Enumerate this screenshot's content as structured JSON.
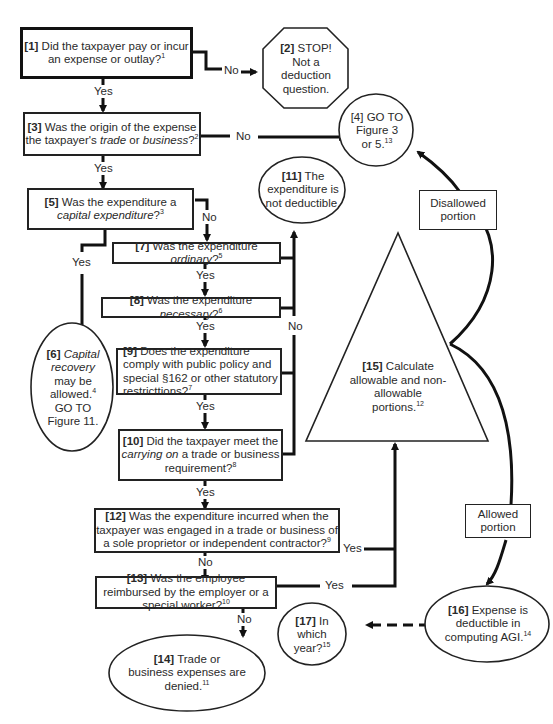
{
  "diagram": {
    "type": "flowchart",
    "nodes": {
      "n1": {
        "num": "[1]",
        "pre": "Did the taxpayer pay or incur an expense or outlay?",
        "fn": "1"
      },
      "n2": {
        "num": "[2]",
        "line1": "STOP!",
        "line2": "Not a",
        "line3": "deduction",
        "line4": "question."
      },
      "n3": {
        "num": "[3]",
        "pre": "Was the origin of the expense the taxpayer's ",
        "it1": "trade",
        "mid": " or ",
        "it2": "business",
        "post": "?",
        "fn": "2"
      },
      "n4": {
        "num": "[4]",
        "line1": "GO TO",
        "line2": "Figure 3",
        "line3": "or 5.",
        "fn": "13"
      },
      "n5": {
        "num": "[5]",
        "pre": "Was the expenditure a",
        "it": "capital expenditure",
        "post": "?",
        "fn": "3"
      },
      "n6": {
        "num": "[6]",
        "it1": "Capital",
        "it2": "recovery",
        "line3": "may be",
        "line4": "allowed.",
        "fn": "4",
        "line5": "GO TO",
        "line6": "Figure 11."
      },
      "n7": {
        "num": "[7]",
        "pre": "Was the expenditure ",
        "it": "ordinary",
        "post": "?",
        "fn": "5"
      },
      "n8": {
        "num": "[8]",
        "pre": "Was the expenditure ",
        "it": "necessary",
        "post": "?",
        "fn": "6"
      },
      "n9": {
        "num": "[9]",
        "text": "Does the expenditure comply with public policy and special §162 or other statutory restricttions?",
        "fn": "7"
      },
      "n10": {
        "num": "[10]",
        "pre": "Did the taxpayer meet the",
        "it": "carrying on",
        "post": " a trade or business requirement?",
        "fn": "8"
      },
      "n11": {
        "num": "[11]",
        "line1": "The",
        "line2": "expenditure is",
        "line3": "not deductible."
      },
      "n12": {
        "num": "[12]",
        "text": "Was the expenditure incurred when the taxpayer was engaged in a trade or business of a sole proprietor or independent contractor?",
        "fn": "9"
      },
      "n13": {
        "num": "[13]",
        "text": "Was the employee reimbursed by the employer or a special worker?",
        "fn": "10"
      },
      "n14": {
        "num": "[14]",
        "line1": "Trade or",
        "line2": "business expenses are",
        "line3": "denied.",
        "fn": "11"
      },
      "n15": {
        "num": "[15]",
        "line1": "Calculate",
        "line2": "allowable and non-",
        "line3": "allowable",
        "line4": "portions.",
        "fn": "12"
      },
      "n16": {
        "num": "[16]",
        "line1": "Expense is",
        "line2": "deductible in",
        "line3": "computing AGI.",
        "fn": "14"
      },
      "n17": {
        "num": "[17]",
        "line1": "In",
        "line2": "which",
        "line3": "year?",
        "fn": "15"
      }
    },
    "labels": {
      "yes": "Yes",
      "no": "No",
      "disallowed_l1": "Disallowed",
      "disallowed_l2": "portion",
      "allowed_l1": "Allowed",
      "allowed_l2": "portion"
    },
    "colors": {
      "line": "#111111",
      "text": "#2a2a2a",
      "background": "#ffffff"
    }
  }
}
